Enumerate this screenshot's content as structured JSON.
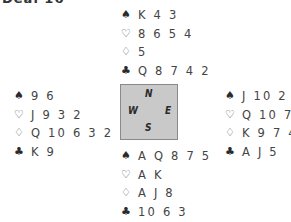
{
  "title": "Deal 16",
  "compass": {
    "north": "N",
    "south": "S",
    "east": "E",
    "west": "W",
    "background": "#c9c9c9"
  },
  "hands": {
    "north": {
      "spades": "K 4 3",
      "hearts": "8 6 5 4",
      "diamonds": "5",
      "clubs": "Q 8 7 4 2"
    },
    "west": {
      "spades": "9 6",
      "hearts": "J 9 3 2",
      "diamonds": "Q 10 6 3 2",
      "clubs": "K 9"
    },
    "east": {
      "spades": "J 10 2",
      "hearts": "Q 10 7",
      "diamonds": "K 9 7 4",
      "clubs": "A J 5"
    },
    "south": {
      "spades": "A Q 8 7 5",
      "hearts": "A K",
      "diamonds": "A J 8",
      "clubs": "10 6 3"
    }
  },
  "suit_icons": {
    "spades": "♠",
    "hearts": "♡",
    "diamonds": "♢",
    "clubs": "♣"
  }
}
